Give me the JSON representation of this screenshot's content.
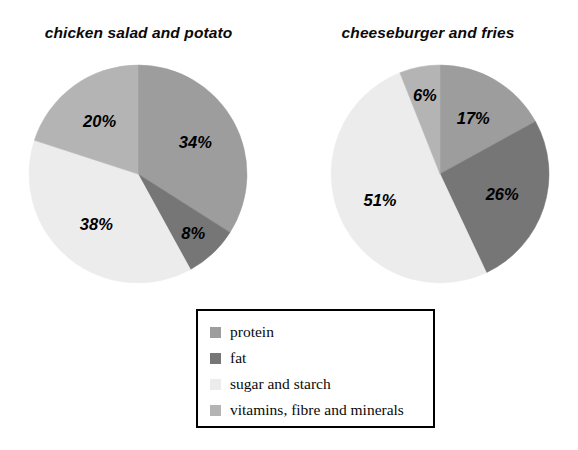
{
  "chart_data": [
    {
      "type": "pie",
      "title": "chicken salad and potato",
      "categories": [
        "protein",
        "fat",
        "sugar and starch",
        "vitamins, fibre and minerals"
      ],
      "values": [
        34,
        8,
        38,
        20
      ],
      "labels": [
        "34%",
        "8%",
        "38%",
        "20%"
      ],
      "colors": [
        "#9d9d9d",
        "#767676",
        "#ececec",
        "#b4b4b4"
      ],
      "start_angle_deg": 0,
      "direction": "clockwise",
      "units": "percent",
      "legend_position": "bottom-center",
      "grid": false
    },
    {
      "type": "pie",
      "title": "cheeseburger and fries",
      "categories": [
        "protein",
        "fat",
        "sugar and starch",
        "vitamins, fibre and minerals"
      ],
      "values": [
        17,
        26,
        51,
        6
      ],
      "labels": [
        "17%",
        "26%",
        "51%",
        "6%"
      ],
      "colors": [
        "#9d9d9d",
        "#767676",
        "#ececec",
        "#b4b4b4"
      ],
      "start_angle_deg": 0,
      "direction": "clockwise",
      "units": "percent",
      "legend_position": "bottom-center",
      "grid": false
    }
  ],
  "titles": {
    "left": "chicken salad and potato",
    "right": "cheeseburger and fries"
  },
  "legend": {
    "items": [
      {
        "label": "protein",
        "color": "#9d9d9d"
      },
      {
        "label": "fat",
        "color": "#767676"
      },
      {
        "label": "sugar and starch",
        "color": "#ececec"
      },
      {
        "label": "vitamins, fibre and minerals",
        "color": "#b4b4b4"
      }
    ]
  },
  "colors": {
    "protein": "#9d9d9d",
    "fat": "#767676",
    "sugar_and_starch": "#ececec",
    "vitamins_fibre_and_minerals": "#b4b4b4",
    "background": "#ffffff",
    "text": "#000000",
    "legend_border": "#000000"
  }
}
